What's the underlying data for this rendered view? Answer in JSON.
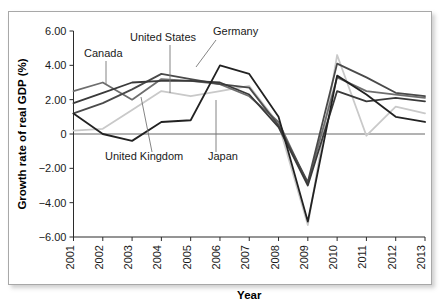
{
  "chart_data": {
    "type": "line",
    "title": "",
    "xlabel": "Year",
    "ylabel": "Growth rate of real GDP (%)",
    "categories": [
      "2001",
      "2002",
      "2003",
      "2004",
      "2005",
      "2006",
      "2007",
      "2008",
      "2009",
      "2010",
      "2011",
      "2012",
      "2013"
    ],
    "x": [
      2001,
      2002,
      2003,
      2004,
      2005,
      2006,
      2007,
      2008,
      2009,
      2010,
      2011,
      2012,
      2013
    ],
    "ylim": [
      -6.0,
      6.0
    ],
    "xlim": [
      2001,
      2013
    ],
    "yticks": [
      6.0,
      4.0,
      2.0,
      0,
      -2.0,
      -4.0,
      -6.0
    ],
    "ytick_labels": [
      "6.00",
      "4.00",
      "2.00",
      "0",
      "-2.00",
      "-4.00",
      "-6.00"
    ],
    "grid": false,
    "legend_position": "inline-annotations",
    "series": [
      {
        "name": "Canada",
        "color": "#6e6e6e",
        "values": [
          2.5,
          3.0,
          2.0,
          3.2,
          3.1,
          2.9,
          2.2,
          0.7,
          -2.9,
          3.3,
          2.5,
          2.3,
          2.1
        ]
      },
      {
        "name": "United States",
        "color": "#4a4a4a",
        "values": [
          1.2,
          1.8,
          2.6,
          3.5,
          3.2,
          2.9,
          2.7,
          0.5,
          -2.8,
          4.1,
          3.3,
          2.4,
          2.2
        ]
      },
      {
        "name": "United Kingdom",
        "color": "#3a3a3a",
        "values": [
          1.8,
          2.4,
          3.0,
          3.1,
          3.1,
          3.0,
          2.3,
          0.4,
          -3.0,
          2.5,
          1.9,
          2.1,
          1.9
        ]
      },
      {
        "name": "Germany",
        "color": "#222222",
        "values": [
          1.2,
          0.0,
          -0.4,
          0.7,
          0.8,
          4.0,
          3.5,
          1.0,
          -5.1,
          3.4,
          2.3,
          1.0,
          0.7
        ]
      },
      {
        "name": "Japan",
        "color": "#c9c9c9",
        "values": [
          0.2,
          0.3,
          1.4,
          2.5,
          2.2,
          2.5,
          2.8,
          0.6,
          -5.3,
          4.6,
          -0.1,
          1.6,
          1.2
        ]
      }
    ],
    "annotations": [
      {
        "text": "Canada",
        "label_x": 84,
        "label_y": 57,
        "anchor": "start",
        "leader": [
          [
            106,
            61
          ],
          [
            106,
            84
          ]
        ]
      },
      {
        "text": "United States",
        "label_x": 130,
        "label_y": 41,
        "anchor": "start",
        "leader": [
          [
            170,
            45
          ],
          [
            170,
            93
          ]
        ]
      },
      {
        "text": "Germany",
        "label_x": 213,
        "label_y": 35,
        "anchor": "start",
        "leader": [
          [
            216,
            40
          ],
          [
            196,
            67
          ]
        ]
      },
      {
        "text": "United Kingdom",
        "label_x": 105,
        "label_y": 160,
        "anchor": "start",
        "leader": [
          [
            152,
            152
          ],
          [
            141,
            97
          ]
        ]
      },
      {
        "text": "Japan",
        "label_x": 208,
        "label_y": 160,
        "anchor": "start",
        "leader": [
          [
            216,
            152
          ],
          [
            216,
            100
          ]
        ]
      }
    ]
  },
  "axis": {
    "x_title": "Year",
    "y_title": "Growth rate of real GDP (%)"
  }
}
